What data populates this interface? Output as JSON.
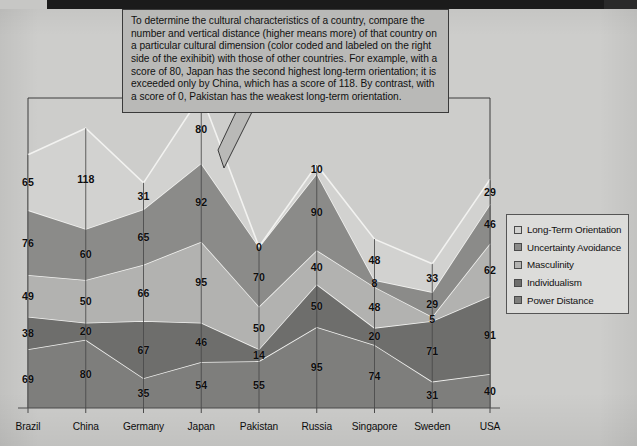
{
  "callout": {
    "text": "To determine the cultural characteristics of a country, compare the number and vertical distance (higher means more) of that country on a particular cultural dimension (color coded and labeled on the right side of the exihibit) with those of other countries.  For example, with a score of 80, Japan has the second highest long-term orientation; it is exceeded only by China, which has a score of 118.  By contrast, with a score of 0, Pakistan has the weakest long-term orientation."
  },
  "legend": {
    "items": [
      {
        "label": "Long-Term Orientation",
        "color": "#d2d2d0"
      },
      {
        "label": "Uncertainty Avoidance",
        "color": "#8b8b89"
      },
      {
        "label": "Masculinity",
        "color": "#b2b2b0"
      },
      {
        "label": "Individualism",
        "color": "#6e6e6c"
      },
      {
        "label": "Power Distance",
        "color": "#7e7e7c"
      }
    ]
  },
  "chart_data": {
    "type": "area",
    "title": "",
    "xlabel": "",
    "ylabel": "",
    "stacked": true,
    "grid": false,
    "legend_position": "right",
    "categories": [
      "Brazil",
      "China",
      "Germany",
      "Japan",
      "Pakistan",
      "Russia",
      "Singapore",
      "Sweden",
      "USA"
    ],
    "series": [
      {
        "name": "Power Distance",
        "color": "#7e7e7c",
        "values": [
          69,
          80,
          35,
          54,
          55,
          95,
          74,
          31,
          40
        ]
      },
      {
        "name": "Individualism",
        "color": "#6e6e6c",
        "values": [
          38,
          20,
          67,
          46,
          14,
          50,
          20,
          71,
          91
        ]
      },
      {
        "name": "Masculinity",
        "color": "#b2b2b0",
        "values": [
          49,
          50,
          66,
          95,
          50,
          40,
          48,
          5,
          62
        ]
      },
      {
        "name": "Uncertainty Avoidance",
        "color": "#8b8b89",
        "values": [
          76,
          60,
          65,
          92,
          70,
          90,
          8,
          29,
          46
        ]
      },
      {
        "name": "Long-Term Orientation",
        "color": "#d2d2d0",
        "values": [
          65,
          118,
          31,
          80,
          0,
          10,
          48,
          33,
          29
        ]
      }
    ],
    "axis": {
      "x_ticks": [
        "Brazil",
        "China",
        "Germany",
        "Japan",
        "Pakistan",
        "Russia",
        "Singapore",
        "Sweden",
        "USA"
      ],
      "ymin": 0,
      "ymax": 340
    }
  }
}
